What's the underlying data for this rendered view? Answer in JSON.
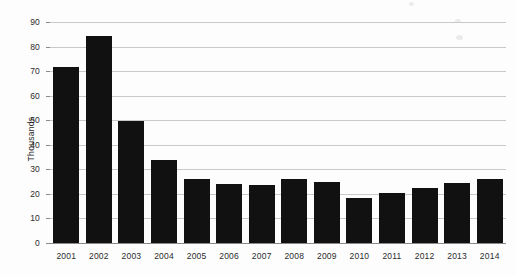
{
  "chart_data": {
    "type": "bar",
    "title": "",
    "subtitle": "",
    "xlabel": "",
    "ylabel": "Thousands",
    "ylim": [
      0,
      90
    ],
    "ytick_step": 10,
    "yticks": [
      0,
      10,
      20,
      30,
      40,
      50,
      60,
      70,
      80,
      90
    ],
    "ytick_labels": [
      "0",
      "10",
      "20",
      "30",
      "40",
      "50",
      "60",
      "70",
      "80",
      "90"
    ],
    "grid": true,
    "grid_axis": "y",
    "legend": false,
    "legend_position": "none",
    "bar_color": "#111111",
    "gridline_color": "#c9c9c9",
    "axis_color": "#8a8a8a",
    "background_color": "#fdfdfd",
    "categories": [
      "2001",
      "2002",
      "2003",
      "2004",
      "2005",
      "2006",
      "2007",
      "2008",
      "2009",
      "2010",
      "2011",
      "2012",
      "2013",
      "2014"
    ],
    "values": [
      71.5,
      84.5,
      49.5,
      34.0,
      26.0,
      24.0,
      23.5,
      26.0,
      25.0,
      18.5,
      20.5,
      22.5,
      24.5,
      26.0
    ],
    "annotations": []
  }
}
